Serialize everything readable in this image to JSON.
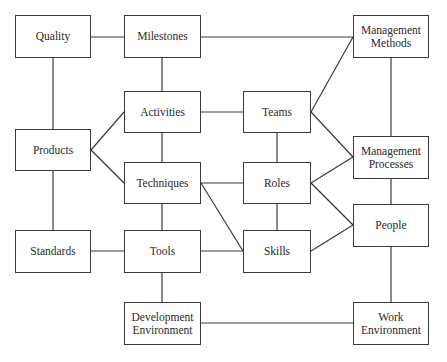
{
  "diagram": {
    "line_color": "#3a3a3a",
    "nodes": {
      "quality": {
        "label": "Quality",
        "x": 15,
        "y": 15,
        "w": 76,
        "h": 43
      },
      "milestones": {
        "label": "Milestones",
        "x": 124,
        "y": 15,
        "w": 77,
        "h": 43
      },
      "mgmt_methods": {
        "label": "Management\nMethods",
        "x": 353,
        "y": 15,
        "w": 76,
        "h": 43
      },
      "activities": {
        "label": "Activities",
        "x": 124,
        "y": 91,
        "w": 77,
        "h": 42
      },
      "teams": {
        "label": "Teams",
        "x": 243,
        "y": 91,
        "w": 68,
        "h": 42
      },
      "products": {
        "label": "Products",
        "x": 15,
        "y": 129,
        "w": 76,
        "h": 42
      },
      "mgmt_processes": {
        "label": "Management\nProcesses",
        "x": 353,
        "y": 136,
        "w": 76,
        "h": 43
      },
      "techniques": {
        "label": "Techniques",
        "x": 124,
        "y": 162,
        "w": 77,
        "h": 42
      },
      "roles": {
        "label": "Roles",
        "x": 243,
        "y": 162,
        "w": 68,
        "h": 42
      },
      "people": {
        "label": "People",
        "x": 353,
        "y": 204,
        "w": 76,
        "h": 43
      },
      "standards": {
        "label": "Standards",
        "x": 15,
        "y": 230,
        "w": 76,
        "h": 43
      },
      "tools": {
        "label": "Tools",
        "x": 124,
        "y": 230,
        "w": 77,
        "h": 43
      },
      "skills": {
        "label": "Skills",
        "x": 243,
        "y": 230,
        "w": 68,
        "h": 43
      },
      "dev_env": {
        "label": "Development\nEnvironment",
        "x": 124,
        "y": 302,
        "w": 77,
        "h": 43
      },
      "work_env": {
        "label": "Work\nEnvironment",
        "x": 353,
        "y": 302,
        "w": 76,
        "h": 43
      }
    },
    "edges": [
      {
        "from": "quality",
        "to": "milestones",
        "x1": 91,
        "y1": 37,
        "x2": 124,
        "y2": 37
      },
      {
        "from": "milestones",
        "to": "mgmt_methods",
        "x1": 201,
        "y1": 37,
        "x2": 353,
        "y2": 37
      },
      {
        "from": "quality",
        "to": "products",
        "x1": 53,
        "y1": 58,
        "x2": 53,
        "y2": 129
      },
      {
        "from": "milestones",
        "to": "activities",
        "x1": 162,
        "y1": 58,
        "x2": 162,
        "y2": 91
      },
      {
        "from": "activities",
        "to": "teams",
        "x1": 201,
        "y1": 112,
        "x2": 243,
        "y2": 112
      },
      {
        "from": "products",
        "to": "activities",
        "x1": 91,
        "y1": 150,
        "x2": 124,
        "y2": 112
      },
      {
        "from": "products",
        "to": "techniques",
        "x1": 91,
        "y1": 150,
        "x2": 124,
        "y2": 183
      },
      {
        "from": "activities",
        "to": "techniques",
        "x1": 162,
        "y1": 133,
        "x2": 162,
        "y2": 162
      },
      {
        "from": "techniques",
        "to": "roles",
        "x1": 201,
        "y1": 183,
        "x2": 243,
        "y2": 183
      },
      {
        "from": "techniques",
        "to": "skills",
        "x1": 201,
        "y1": 183,
        "x2": 243,
        "y2": 251
      },
      {
        "from": "teams",
        "to": "mgmt_methods",
        "x1": 311,
        "y1": 112,
        "x2": 353,
        "y2": 37
      },
      {
        "from": "teams",
        "to": "mgmt_processes",
        "x1": 311,
        "y1": 112,
        "x2": 353,
        "y2": 157
      },
      {
        "from": "teams",
        "to": "roles",
        "x1": 277,
        "y1": 133,
        "x2": 277,
        "y2": 162
      },
      {
        "from": "roles",
        "to": "mgmt_processes",
        "x1": 311,
        "y1": 183,
        "x2": 353,
        "y2": 157
      },
      {
        "from": "roles",
        "to": "people",
        "x1": 311,
        "y1": 183,
        "x2": 353,
        "y2": 225
      },
      {
        "from": "roles",
        "to": "skills",
        "x1": 277,
        "y1": 204,
        "x2": 277,
        "y2": 230
      },
      {
        "from": "skills",
        "to": "people",
        "x1": 311,
        "y1": 251,
        "x2": 353,
        "y2": 225
      },
      {
        "from": "mgmt_methods",
        "to": "mgmt_processes",
        "x1": 391,
        "y1": 58,
        "x2": 391,
        "y2": 136
      },
      {
        "from": "mgmt_processes",
        "to": "people",
        "x1": 391,
        "y1": 179,
        "x2": 391,
        "y2": 204
      },
      {
        "from": "people",
        "to": "work_env",
        "x1": 391,
        "y1": 247,
        "x2": 391,
        "y2": 302
      },
      {
        "from": "products",
        "to": "standards",
        "x1": 53,
        "y1": 171,
        "x2": 53,
        "y2": 230
      },
      {
        "from": "standards",
        "to": "tools",
        "x1": 91,
        "y1": 251,
        "x2": 124,
        "y2": 251
      },
      {
        "from": "techniques",
        "to": "tools",
        "x1": 162,
        "y1": 204,
        "x2": 162,
        "y2": 230
      },
      {
        "from": "tools",
        "to": "skills",
        "x1": 201,
        "y1": 251,
        "x2": 243,
        "y2": 251
      },
      {
        "from": "tools",
        "to": "dev_env",
        "x1": 162,
        "y1": 273,
        "x2": 162,
        "y2": 302
      },
      {
        "from": "dev_env",
        "to": "work_env",
        "x1": 201,
        "y1": 323,
        "x2": 353,
        "y2": 323
      }
    ]
  }
}
